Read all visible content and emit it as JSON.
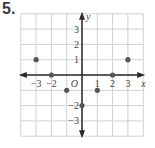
{
  "problem": {
    "number": "5."
  },
  "chart_data": {
    "type": "scatter",
    "title": "",
    "xlabel": "x",
    "ylabel": "y",
    "origin_label": "O",
    "xlim": [
      -4,
      4
    ],
    "ylim": [
      -4,
      4
    ],
    "grid": true,
    "x_tick_labels": [
      "-3",
      "-2",
      "1",
      "2",
      "3"
    ],
    "y_tick_labels": [
      "3",
      "2",
      "1",
      "-2",
      "-3"
    ],
    "points": [
      {
        "x": -3,
        "y": 1
      },
      {
        "x": -2,
        "y": 0
      },
      {
        "x": -1,
        "y": -1
      },
      {
        "x": 0,
        "y": -2
      },
      {
        "x": 1,
        "y": -1
      },
      {
        "x": 2,
        "y": 0
      },
      {
        "x": 3,
        "y": 1
      }
    ],
    "colors": {
      "grid": "#d0d0d0",
      "axis": "#2a2a2a",
      "point": "#555555",
      "label": "#444444"
    }
  }
}
